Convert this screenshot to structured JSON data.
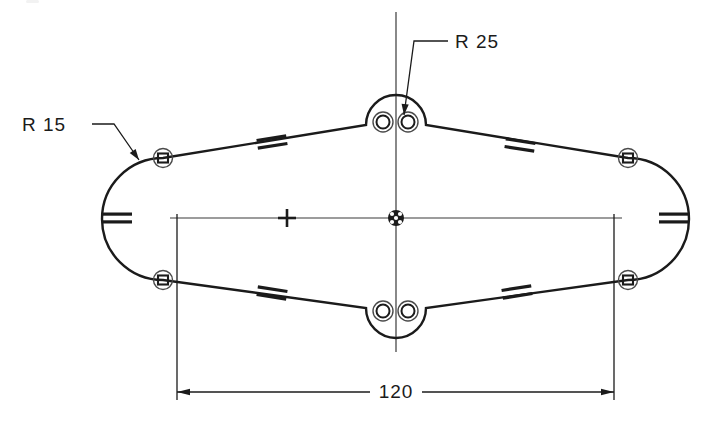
{
  "drawing": {
    "type": "cad-sketch",
    "description": "Parametric 2D CAD sketch of an elongated rounded hexagonal profile with tangent arcs and geometric constraint markers",
    "background_color": "#ffffff",
    "line_color": "#1b1b1b",
    "thin_line_color": "#3a3a3a",
    "annotations": [
      {
        "id": "radius-left",
        "label": "R 15",
        "value": 15,
        "symbol": "R",
        "text_x": 22,
        "text_y": 131,
        "leader": [
          [
            92,
            124
          ],
          [
            114,
            124
          ],
          [
            139,
            160
          ]
        ],
        "arrow_at": [
          139,
          160
        ],
        "arrow_angle": 55
      },
      {
        "id": "radius-top",
        "label": "R 25",
        "value": 25,
        "symbol": "R",
        "text_x": 455,
        "text_y": 48,
        "leader": [
          [
            448,
            41
          ],
          [
            414,
            41
          ],
          [
            404,
            115
          ]
        ],
        "arrow_at": [
          404,
          115
        ],
        "arrow_angle": 96
      },
      {
        "id": "length-overall",
        "label": "120",
        "value": 120,
        "text_x": 396,
        "text_y": 398,
        "dimension_line_y": 392,
        "dimension_x1": 177,
        "dimension_x2": 614,
        "extension_left_x": 177,
        "extension_left_y1": 214,
        "extension_left_y2": 400,
        "extension_right_x": 614,
        "extension_right_y1": 214,
        "extension_right_y2": 400
      }
    ],
    "centerlines": {
      "horizontal": {
        "x1": 170,
        "y1": 218,
        "x2": 622,
        "y2": 218
      },
      "vertical": {
        "x1": 396,
        "y1": 12,
        "x2": 396,
        "y2": 352
      }
    },
    "point_markers": [
      {
        "id": "sketch-point-left",
        "x": 287,
        "y": 218,
        "glyph": "plus",
        "size": 9
      },
      {
        "id": "origin-point",
        "x": 396,
        "y": 218,
        "glyph": "origin",
        "size": 8
      }
    ],
    "profile": {
      "left_arc_center_x": 177,
      "right_arc_center_x": 614,
      "center_y": 218,
      "arc_radius": 60,
      "top_vertex": {
        "x": 396,
        "y": 122
      },
      "bottom_vertex": {
        "x": 396,
        "y": 311
      },
      "tangent_upper_left": {
        "x": 163,
        "y": 158
      },
      "tangent_upper_right": {
        "x": 628,
        "y": 158
      },
      "tangent_lower_left": {
        "x": 163,
        "y": 280
      },
      "tangent_lower_right": {
        "x": 628,
        "y": 280
      }
    },
    "constraints": [
      {
        "id": "coincident-upper-left",
        "type": "coincident",
        "glyph": "square-in-circle",
        "x": 163,
        "y": 158
      },
      {
        "id": "coincident-upper-right",
        "type": "coincident",
        "glyph": "square-in-circle",
        "x": 628,
        "y": 158
      },
      {
        "id": "coincident-lower-left",
        "type": "coincident",
        "glyph": "square-in-circle",
        "x": 163,
        "y": 280
      },
      {
        "id": "coincident-lower-right",
        "type": "coincident",
        "glyph": "square-in-circle",
        "x": 628,
        "y": 280
      },
      {
        "id": "tangent-left-extreme",
        "type": "tangent",
        "glyph": "double-dash",
        "x": 117,
        "y": 218
      },
      {
        "id": "tangent-right-extreme",
        "type": "tangent",
        "glyph": "double-dash",
        "x": 674,
        "y": 218
      },
      {
        "id": "parallel-upper-left",
        "type": "parallel",
        "glyph": "double-dash",
        "x": 272,
        "y": 142,
        "angle": -9
      },
      {
        "id": "parallel-upper-right",
        "type": "parallel",
        "glyph": "double-dash",
        "x": 520,
        "y": 145,
        "angle": 9
      },
      {
        "id": "parallel-lower-left",
        "type": "parallel",
        "glyph": "double-dash",
        "x": 272,
        "y": 293,
        "angle": 9
      },
      {
        "id": "parallel-lower-right",
        "type": "parallel",
        "glyph": "double-dash",
        "x": 517,
        "y": 292,
        "angle": -9
      },
      {
        "id": "merge-top-vertex-a",
        "type": "merge",
        "glyph": "double-circle",
        "x": 383,
        "y": 122
      },
      {
        "id": "merge-top-vertex-b",
        "type": "merge",
        "glyph": "double-circle",
        "x": 408,
        "y": 122
      },
      {
        "id": "merge-bottom-vertex-a",
        "type": "merge",
        "glyph": "double-circle",
        "x": 383,
        "y": 311
      },
      {
        "id": "merge-bottom-vertex-b",
        "type": "merge",
        "glyph": "double-circle",
        "x": 408,
        "y": 311
      }
    ]
  }
}
